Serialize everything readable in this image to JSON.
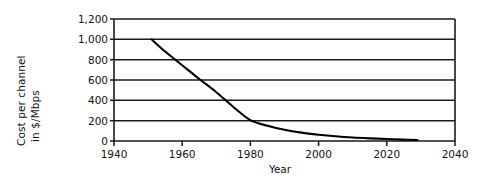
{
  "chart_data": {
    "type": "line",
    "title": "",
    "xlabel": "Year",
    "ylabel": "Cost per channel in $/Mbps",
    "ylabel_lines": [
      "Cost per channel",
      "in $/Mbps"
    ],
    "xlim": [
      1940,
      2040
    ],
    "ylim": [
      0,
      1200
    ],
    "xticks": [
      1940,
      1960,
      1980,
      2000,
      2020,
      2040
    ],
    "xtick_labels": [
      "1940",
      "1960",
      "1980",
      "2000",
      "2020",
      "2040"
    ],
    "yticks": [
      0,
      200,
      400,
      600,
      800,
      1000,
      1200
    ],
    "ytick_labels": [
      "0",
      "200",
      "400",
      "600",
      "800",
      "1,000",
      "1,200"
    ],
    "grid": "horizontal",
    "legend": "none",
    "series": [
      {
        "name": "Cost per channel",
        "color": "#000000",
        "x": [
          1951,
          1955,
          1960,
          1965,
          1970,
          1975,
          1980,
          1985,
          1990,
          1995,
          2000,
          2005,
          2010,
          2015,
          2020,
          2025,
          2029
        ],
        "values": [
          1000,
          880,
          745,
          610,
          480,
          335,
          205,
          150,
          110,
          82,
          62,
          46,
          34,
          26,
          20,
          14,
          10
        ]
      }
    ],
    "annotations": []
  },
  "axes": {
    "y_title_line1": "Cost per channel",
    "y_title_line2": "in $/Mbps",
    "x_title": "Year"
  },
  "style": {
    "axis_color": "#1a1a1a",
    "grid_color": "#1a1a1a",
    "curve_color": "#000000",
    "background": "#ffffff"
  }
}
